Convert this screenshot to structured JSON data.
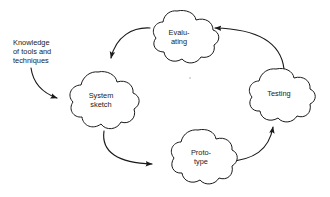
{
  "diagram": {
    "type": "cycle-diagram",
    "title": "",
    "orientation": "clockwise",
    "nodes": [
      {
        "id": "system-sketch",
        "shape": "cloud",
        "label_line1": "System",
        "label_line2": "sketch",
        "position": "left",
        "cx": 98,
        "cy": 100
      },
      {
        "id": "prototype",
        "shape": "cloud",
        "label_line1": "Proto-",
        "label_line2": "type",
        "position": "bottom",
        "cx": 198,
        "cy": 157
      },
      {
        "id": "testing",
        "shape": "cloud",
        "label_line1": "Testing",
        "label_line2": "",
        "position": "right",
        "cx": 276,
        "cy": 95
      },
      {
        "id": "evaluating",
        "shape": "cloud",
        "label_line1": "Evalu-",
        "label_line2": "ating",
        "position": "top",
        "cx": 177,
        "cy": 37
      }
    ],
    "edges": [
      {
        "id": "edge-evaluating-to-system-sketch",
        "from": "evaluating",
        "to": "system-sketch",
        "style": "curved-arrow"
      },
      {
        "id": "edge-system-sketch-to-prototype",
        "from": "system-sketch",
        "to": "prototype",
        "style": "curved-arrow"
      },
      {
        "id": "edge-prototype-to-testing",
        "from": "prototype",
        "to": "testing",
        "style": "curved-arrow"
      },
      {
        "id": "edge-testing-to-evaluating",
        "from": "testing",
        "to": "evaluating",
        "style": "curved-arrow"
      }
    ],
    "external_input": {
      "id": "knowledge-input",
      "target": "system-sketch",
      "label_line1": "Knowledge",
      "label_line2": "of tools and",
      "label_line3": "techniques"
    },
    "colors": {
      "ink": "#1a1a1a",
      "background": "#ffffff"
    }
  }
}
